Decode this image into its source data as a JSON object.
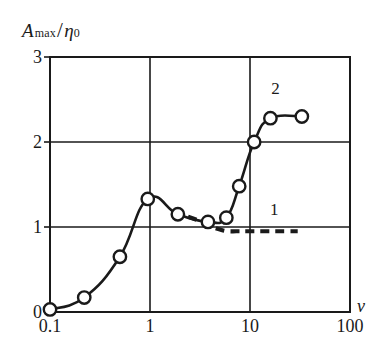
{
  "chart_data": {
    "type": "line",
    "title": "",
    "xlabel": "v",
    "ylabel": "A max / η 0",
    "ylabel_parts": {
      "main": "A",
      "subscript": "max",
      "divider": "/",
      "denominator": "η",
      "denominator_subscript": "0"
    },
    "xscale": "log",
    "yscale": "linear",
    "xlim": [
      0.1,
      100
    ],
    "ylim": [
      0,
      3
    ],
    "xticks": [
      "0.1",
      "1",
      "10",
      "100"
    ],
    "xtick_values": [
      0.1,
      1,
      10,
      100
    ],
    "yticks": [
      "0",
      "1",
      "2",
      "3"
    ],
    "ytick_values": [
      0,
      1,
      2,
      3
    ],
    "grid": "major gridlines at v=1, v=10 and A/η=1, A/η=2",
    "legend_position": "inline annotations",
    "series": [
      {
        "name": "1",
        "label": "1",
        "style": "dashed",
        "markers": "none",
        "label_x": 17.5,
        "label_y": 1.2,
        "x": [
          2.4,
          3.0,
          3.6,
          4.2,
          5.0,
          6.0,
          7.3,
          9.0,
          11.0,
          14.0,
          18.0,
          23.0,
          30.0
        ],
        "y": [
          1.12,
          1.08,
          1.04,
          1.0,
          0.97,
          0.95,
          0.95,
          0.95,
          0.95,
          0.95,
          0.95,
          0.95,
          0.95
        ]
      },
      {
        "name": "2",
        "label": "2",
        "style": "solid",
        "markers": "open-circle",
        "label_x": 18.0,
        "label_y": 2.62,
        "x": [
          0.1,
          0.22,
          0.5,
          0.95,
          1.9,
          3.8,
          5.8,
          7.8,
          11.0,
          16.0,
          33.0
        ],
        "y": [
          0.03,
          0.17,
          0.65,
          1.33,
          1.15,
          1.06,
          1.11,
          1.48,
          2.0,
          2.28,
          2.3
        ]
      }
    ]
  },
  "axes": {
    "xlabel": "v",
    "ylabel_main": "A",
    "ylabel_sub": "max",
    "ylabel_slash": "/",
    "ylabel_eta": "η",
    "ylabel_eta_sub": "0",
    "xticks": [
      {
        "text": "0.1"
      },
      {
        "text": "1"
      },
      {
        "text": "10"
      },
      {
        "text": "100"
      }
    ],
    "yticks": [
      {
        "text": "0"
      },
      {
        "text": "1"
      },
      {
        "text": "2"
      },
      {
        "text": "3"
      }
    ]
  },
  "annotations": [
    {
      "text": "1"
    },
    {
      "text": "2"
    }
  ],
  "colors": {
    "background": "#ffffff",
    "frame": "#1a1a1a",
    "grid": "#1a1a1a",
    "curve": "#1a1a1a",
    "marker_fill": "#ffffff",
    "text": "#1a1a1a"
  }
}
